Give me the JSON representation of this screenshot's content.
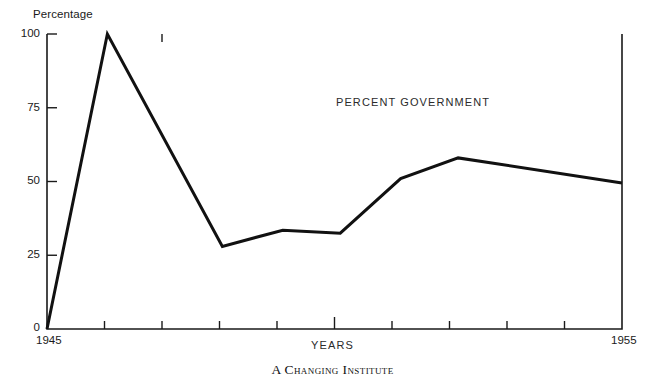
{
  "figure": {
    "caption": "A Changing Institute",
    "annotation": "PERCENT GOVERNMENT",
    "y_axis_title": "Percentage",
    "x_axis_title": "YEARS"
  },
  "chart_data": {
    "type": "line",
    "title": "",
    "subtitle": "",
    "xlabel": "YEARS",
    "ylabel": "Percentage",
    "xlim": [
      1945,
      1955
    ],
    "ylim": [
      0,
      100
    ],
    "grid": false,
    "legend": null,
    "annotations": [
      {
        "text": "PERCENT GOVERNMENT",
        "x": 1950.0,
        "y": 79
      }
    ],
    "xticks": [
      1945,
      1946,
      1947,
      1948,
      1949,
      1950,
      1951,
      1952,
      1953,
      1954,
      1955
    ],
    "xtick_labels": [
      "1945",
      "",
      "",
      "",
      "",
      "",
      "",
      "",
      "",
      "",
      "1955"
    ],
    "yticks": [
      0,
      25,
      50,
      75,
      100
    ],
    "ytick_labels": [
      "0",
      "25",
      "50",
      "75",
      "100"
    ],
    "series": [
      {
        "name": "Percent government",
        "color": "#111111",
        "x": [
          1945.0,
          1946.05,
          1948.05,
          1949.1,
          1950.1,
          1951.15,
          1952.15,
          1955.0
        ],
        "values": [
          0,
          100,
          28,
          33.5,
          32.5,
          51,
          58,
          49.5
        ]
      }
    ]
  }
}
